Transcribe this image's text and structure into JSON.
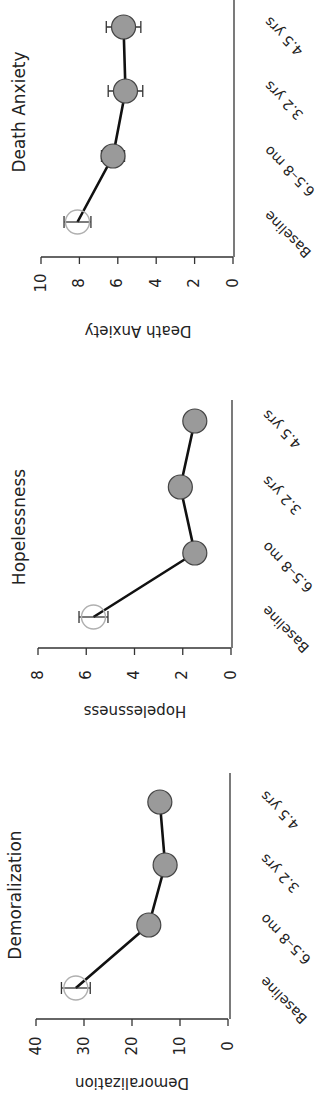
{
  "figure": {
    "orientation": "rotated 90° counter-clockwise",
    "panels_top_to_bottom": [
      "Death Anxiety",
      "Hopelessness",
      "Demoralization"
    ]
  },
  "chart_data": [
    {
      "type": "line",
      "title": "Death Anxiety",
      "xlabel": "",
      "ylabel": "Death Anxiety",
      "categories": [
        "Baseline",
        "6.5–8 mo",
        "3.2 yrs",
        "4.5 yrs"
      ],
      "values": [
        8.1,
        6.25,
        5.6,
        5.7
      ],
      "errors": [
        0.7,
        0.6,
        0.9,
        0.9
      ],
      "ylim": [
        0,
        10
      ],
      "yticks": [
        0,
        2,
        4,
        6,
        8,
        10
      ],
      "grid": false,
      "markers": [
        "open",
        "filled",
        "filled",
        "filled"
      ]
    },
    {
      "type": "line",
      "title": "Hopelessness",
      "xlabel": "",
      "ylabel": "Hopelessness",
      "categories": [
        "Baseline",
        "6.5–8 mo",
        "3.2 yrs",
        "4.5 yrs"
      ],
      "values": [
        5.7,
        1.5,
        2.1,
        1.5
      ],
      "errors": [
        0.6,
        0.3,
        0.4,
        0.3
      ],
      "ylim": [
        0,
        8
      ],
      "yticks": [
        0,
        2,
        4,
        6,
        8
      ],
      "grid": false,
      "markers": [
        "open",
        "filled",
        "filled",
        "filled"
      ]
    },
    {
      "type": "line",
      "title": "Demoralization",
      "xlabel": "",
      "ylabel": "Demoralization",
      "categories": [
        "Baseline",
        "6.5–8 mo",
        "3.2 yrs",
        "4.5 yrs"
      ],
      "values": [
        31.7,
        16.5,
        13.1,
        14.2
      ],
      "errors": [
        3.0,
        2.0,
        0.0,
        2.0
      ],
      "ylim": [
        0,
        40
      ],
      "yticks": [
        0,
        10,
        20,
        30,
        40
      ],
      "grid": false,
      "markers": [
        "open",
        "filled",
        "filled",
        "filled"
      ]
    }
  ],
  "layout": {
    "panels": [
      {
        "axisY": 257,
        "x0": 233,
        "xMax": 41,
        "spineX": 234,
        "spineTop": 0,
        "ptY": [
          222,
          156,
          91,
          27
        ],
        "titleX": 20,
        "titleY": 112,
        "ylabelX": 138,
        "ylabelY": 330,
        "tickLabelY": 283,
        "xtickX": 270,
        "xtickY": [
          210,
          145,
          80,
          16
        ]
      },
      {
        "axisY": 648,
        "x0": 231,
        "xMax": 38,
        "spineX": 232,
        "spineTop": 400,
        "ptY": [
          617,
          553,
          487,
          421
        ],
        "titleX": 20,
        "titleY": 527,
        "ylabelX": 135,
        "ylabelY": 710,
        "tickLabelY": 675,
        "xtickX": 268,
        "xtickY": [
          605,
          541,
          475,
          409
        ]
      },
      {
        "axisY": 1019,
        "x0": 228,
        "xMax": 36,
        "spineX": 230,
        "spineTop": 773,
        "ptY": [
          988,
          925,
          865,
          802
        ],
        "titleX": 16,
        "titleY": 895,
        "ylabelX": 132,
        "ylabelY": 1082,
        "tickLabelY": 1046,
        "xtickX": 266,
        "xtickY": [
          976,
          913,
          853,
          790
        ]
      }
    ],
    "colors": {
      "marker_fill": "#9a9a9a",
      "marker_open_stroke": "#b0b0b0",
      "line": "#111111",
      "axis": "#333333"
    },
    "marker_radius": 12
  }
}
